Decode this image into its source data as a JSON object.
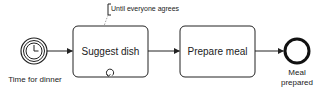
{
  "diagram": {
    "type": "BPMN process",
    "colors": {
      "stroke": "#222222",
      "background": "#ffffff",
      "annotation_connector": "#888888"
    },
    "start_event": {
      "kind": "timer",
      "label": "Time for dinner",
      "icon": "clock-icon"
    },
    "tasks": [
      {
        "label": "Suggest dish",
        "marker": "loop-icon"
      },
      {
        "label": "Prepare meal"
      }
    ],
    "end_event": {
      "label_line1": "Meal",
      "label_line2": "prepared"
    },
    "annotation": {
      "text": "Until everyone agrees",
      "attached_to": "Suggest dish"
    },
    "flows": [
      {
        "from": "Time for dinner",
        "to": "Suggest dish"
      },
      {
        "from": "Suggest dish",
        "to": "Prepare meal"
      },
      {
        "from": "Prepare meal",
        "to": "Meal prepared"
      }
    ]
  }
}
